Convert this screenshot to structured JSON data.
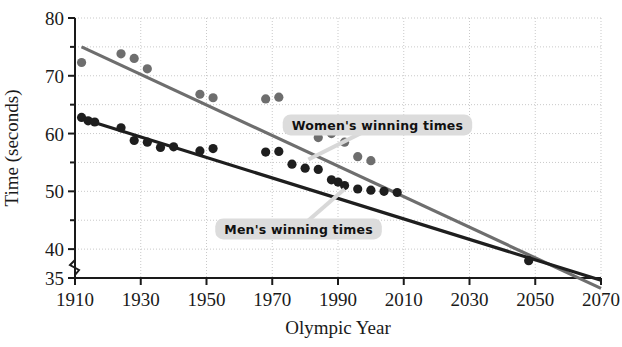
{
  "chart_data": {
    "type": "scatter",
    "title": "",
    "xlabel": "Olympic Year",
    "ylabel": "Time (seconds)",
    "xlim": [
      1910,
      2070
    ],
    "ylim": [
      35,
      80
    ],
    "xticks": [
      "1910",
      "1930",
      "1950",
      "1970",
      "1990",
      "2010",
      "2030",
      "2050",
      "2070"
    ],
    "xtick_values": [
      1910,
      1930,
      1950,
      1970,
      1990,
      2010,
      2030,
      2050,
      2070
    ],
    "yticks": [
      "80",
      "70",
      "60",
      "50",
      "40",
      "35"
    ],
    "ytick_values": [
      80,
      70,
      60,
      50,
      40,
      35
    ],
    "yticks_minor": [
      75,
      65,
      55,
      45
    ],
    "grid": true,
    "y_axis_break": true,
    "series": [
      {
        "name": "Women's winning times",
        "color": "#6e6e6e",
        "label_text": "Women's winning times",
        "trendline": {
          "x": [
            1912,
            2070
          ],
          "y": [
            75.0,
            33.2
          ]
        },
        "points": [
          {
            "x": 1912,
            "y": 72.3
          },
          {
            "x": 1924,
            "y": 73.8
          },
          {
            "x": 1928,
            "y": 73.0
          },
          {
            "x": 1932,
            "y": 71.2
          },
          {
            "x": 1948,
            "y": 66.8
          },
          {
            "x": 1952,
            "y": 66.2
          },
          {
            "x": 1968,
            "y": 66.0
          },
          {
            "x": 1972,
            "y": 66.3
          },
          {
            "x": 1976,
            "y": 62.3
          },
          {
            "x": 1980,
            "y": 61.0
          },
          {
            "x": 1984,
            "y": 59.3
          },
          {
            "x": 1988,
            "y": 60.0
          },
          {
            "x": 1992,
            "y": 58.5
          },
          {
            "x": 1996,
            "y": 56.0
          },
          {
            "x": 2000,
            "y": 55.3
          }
        ]
      },
      {
        "name": "Men's winning times",
        "color": "#1e1e1e",
        "label_text": "Men's winning times",
        "trendline": {
          "x": [
            1912,
            2070
          ],
          "y": [
            62.6,
            34.6
          ]
        },
        "points": [
          {
            "x": 1912,
            "y": 62.8
          },
          {
            "x": 1914,
            "y": 62.2
          },
          {
            "x": 1916,
            "y": 62.0
          },
          {
            "x": 1924,
            "y": 61.0
          },
          {
            "x": 1928,
            "y": 58.8
          },
          {
            "x": 1932,
            "y": 58.5
          },
          {
            "x": 1936,
            "y": 57.6
          },
          {
            "x": 1940,
            "y": 57.7
          },
          {
            "x": 1948,
            "y": 57.0
          },
          {
            "x": 1952,
            "y": 57.4
          },
          {
            "x": 1968,
            "y": 56.8
          },
          {
            "x": 1972,
            "y": 56.9
          },
          {
            "x": 1976,
            "y": 54.7
          },
          {
            "x": 1980,
            "y": 54.0
          },
          {
            "x": 1984,
            "y": 53.8
          },
          {
            "x": 1988,
            "y": 52.0
          },
          {
            "x": 1990,
            "y": 51.6
          },
          {
            "x": 1992,
            "y": 51.0
          },
          {
            "x": 1996,
            "y": 50.4
          },
          {
            "x": 2000,
            "y": 50.2
          },
          {
            "x": 2004,
            "y": 50.0
          },
          {
            "x": 2008,
            "y": 49.8
          }
        ]
      }
    ],
    "intersection": {
      "x": 2048,
      "y": 38.0,
      "marked": true
    },
    "annotations": [
      {
        "text": "Women's winning times",
        "x": 2002,
        "y": 61.5
      },
      {
        "text": "Men's winning times",
        "x": 1978,
        "y": 43.5
      }
    ]
  }
}
